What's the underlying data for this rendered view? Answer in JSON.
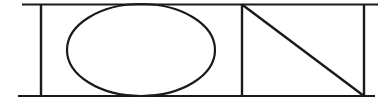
{
  "figure": {
    "canvas": {
      "width": 389,
      "height": 105,
      "background_color": "#ffffff"
    },
    "style": {
      "stroke_color": "#1a1a1a",
      "stroke_width": 2.2,
      "fill": "none"
    },
    "shapes": [
      {
        "name": "top-horizontal-rule",
        "type": "line",
        "x1": 22,
        "y1": 4.5,
        "x2": 378,
        "y2": 4.5
      },
      {
        "name": "bottom-horizontal-rule",
        "type": "line",
        "x1": 18,
        "y1": 96,
        "x2": 375,
        "y2": 96
      },
      {
        "name": "left-vertical-rule",
        "type": "line",
        "x1": 41,
        "y1": 4,
        "x2": 41,
        "y2": 96
      },
      {
        "name": "middle-vertical-divider",
        "type": "line",
        "x1": 242,
        "y1": 4,
        "x2": 242,
        "y2": 96
      },
      {
        "name": "right-vertical-rule",
        "type": "line",
        "x1": 364,
        "y1": 4,
        "x2": 364,
        "y2": 96
      },
      {
        "name": "inscribed-ellipse",
        "type": "ellipse",
        "cx": 141,
        "cy": 50,
        "rx": 74,
        "ry": 46
      },
      {
        "name": "triangle-diagonal",
        "type": "line",
        "x1": 242,
        "y1": 4.5,
        "x2": 364,
        "y2": 96
      }
    ]
  }
}
